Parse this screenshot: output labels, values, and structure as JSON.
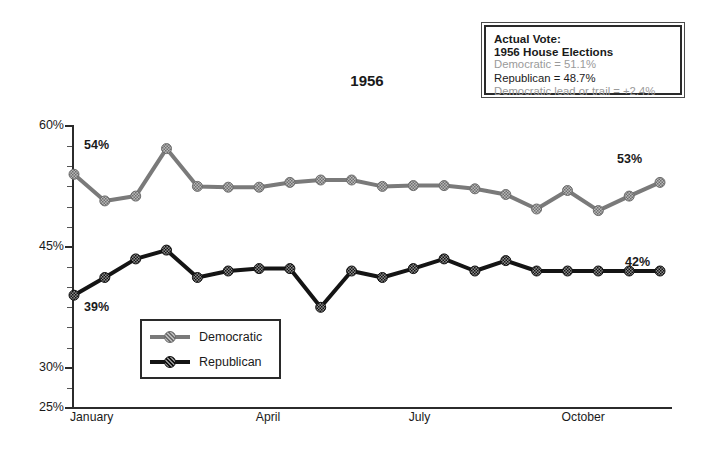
{
  "chart_data": {
    "type": "line",
    "title": "1956",
    "xlabel": "",
    "ylabel": "",
    "ylim": [
      25,
      60
    ],
    "ytick_labels": [
      "60%",
      "45%",
      "30%",
      "25%"
    ],
    "ytick_values": [
      60,
      45,
      30,
      25
    ],
    "minor_ticks": true,
    "grid": false,
    "legend_position": "inside-lower-left",
    "x_tick_labels": [
      "January",
      "April",
      "July",
      "October"
    ],
    "x_tick_positions": [
      0,
      8,
      14,
      20
    ],
    "x": [
      1,
      2,
      3,
      4,
      5,
      6,
      7,
      8,
      9,
      10,
      11,
      12,
      13,
      14,
      15,
      16,
      17,
      18,
      19,
      20,
      21,
      22,
      23,
      24
    ],
    "series": [
      {
        "name": "Democratic",
        "color": "#7a7a7a",
        "values": [
          54.0,
          50.7,
          51.3,
          57.2,
          52.5,
          52.4,
          52.4,
          53.0,
          53.3,
          53.3,
          52.5,
          52.6,
          52.6,
          52.2,
          51.5,
          49.7,
          52.0,
          49.5,
          51.3,
          53.0,
          42.0,
          42.0,
          42.0,
          42.0
        ],
        "values_note": "read off axis; final plotted point 53",
        "start_label": "54%",
        "end_label": "53%"
      },
      {
        "name": "Republican",
        "color": "#141414",
        "values": [
          39.0,
          41.2,
          43.5,
          44.6,
          41.2,
          42.0,
          42.3,
          42.3,
          37.5,
          42.0,
          41.2,
          42.3,
          43.5,
          42.0,
          43.3,
          42.0,
          42.0,
          42.0,
          42.0,
          42.0,
          42.0,
          42.0,
          42.0,
          42.0
        ],
        "values_note": "read off axis; final plotted point 42",
        "start_label": "39%",
        "end_label": "42%"
      }
    ]
  },
  "annotation": {
    "line1": "Actual Vote:",
    "line2": "1956 House Elections",
    "line3": "Democratic = 51.1%",
    "line4": "Republican = 48.7%",
    "line5": "Democratic lead or trail = +2.4%"
  },
  "legend": {
    "items": [
      {
        "label": "Democratic",
        "color": "#7a7a7a"
      },
      {
        "label": "Republican",
        "color": "#141414"
      }
    ]
  },
  "labels": {
    "dem_start": "54%",
    "dem_end": "53%",
    "rep_start": "39%",
    "rep_end": "42%"
  },
  "axis": {
    "y": [
      "60%",
      "45%",
      "30%",
      "25%"
    ],
    "x": [
      "January",
      "April",
      "July",
      "October"
    ]
  },
  "colors": {
    "democratic": "#7a7a7a",
    "republican": "#141414",
    "axis": "#2b2b2b",
    "annotation_grey": "#9a9a9a",
    "text": "#1a1a1a"
  }
}
